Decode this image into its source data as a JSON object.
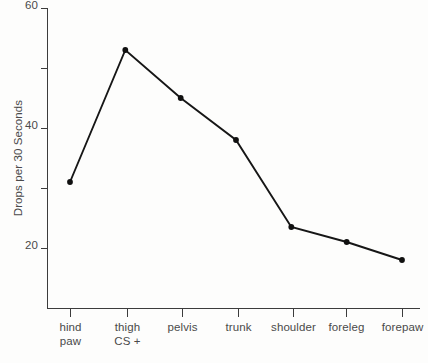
{
  "chart_data": {
    "type": "line",
    "title": "",
    "xlabel": "",
    "ylabel": "Drops per 30 Seconds",
    "categories": [
      "hind paw",
      "thigh CS +",
      "pelvis",
      "trunk",
      "shoulder",
      "foreleg",
      "forepaw"
    ],
    "category_lines": [
      [
        "hind",
        "paw"
      ],
      [
        "thigh",
        "CS +"
      ],
      [
        "pelvis",
        ""
      ],
      [
        "trunk",
        ""
      ],
      [
        "shoulder",
        ""
      ],
      [
        "foreleg",
        ""
      ],
      [
        "forepaw",
        ""
      ]
    ],
    "values": [
      31,
      53,
      45,
      38,
      23.5,
      21,
      18
    ],
    "ylim": [
      12,
      60
    ],
    "yticks": [
      20,
      30,
      40,
      50,
      60
    ],
    "ytick_labels": [
      "20",
      "",
      "40",
      "",
      "60"
    ],
    "grid": false,
    "legend": false,
    "series": [
      {
        "name": "Drops per 30 Seconds",
        "values": [
          31,
          53,
          45,
          38,
          23.5,
          21,
          18
        ]
      }
    ],
    "marker": "filled-circle",
    "line_color": "#161616",
    "axis_color": "#3c3c3c",
    "text_color": "#4a4a4a",
    "background_color": "#fdfdfc"
  }
}
